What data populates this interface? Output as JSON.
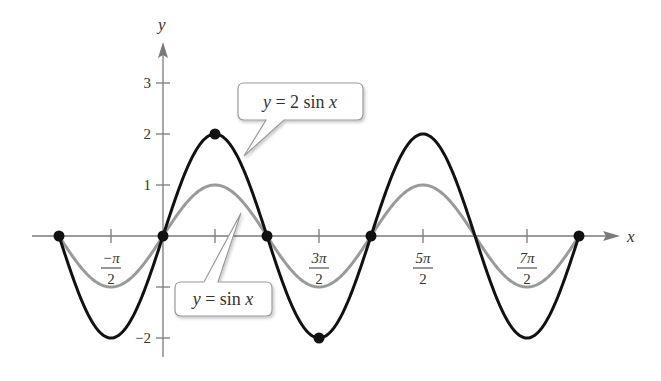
{
  "chart_data": {
    "type": "line",
    "title": "",
    "xlabel": "x",
    "ylabel": "y",
    "xlim": [
      -3.1416,
      12.5664
    ],
    "ylim": [
      -2.4,
      3.7
    ],
    "grid": false,
    "x_ticks": [
      {
        "value": -1.5708,
        "label_num": "−π",
        "label_den": "2",
        "labeled": true
      },
      {
        "value": 1.5708,
        "label_num": "",
        "label_den": "",
        "labeled": false
      },
      {
        "value": 4.7124,
        "label_num": "3π",
        "label_den": "2",
        "labeled": true
      },
      {
        "value": 7.854,
        "label_num": "5π",
        "label_den": "2",
        "labeled": true
      },
      {
        "value": 10.9956,
        "label_num": "7π",
        "label_den": "2",
        "labeled": true
      }
    ],
    "y_ticks": [
      {
        "value": 3,
        "label": "3"
      },
      {
        "value": 2,
        "label": "2"
      },
      {
        "value": 1,
        "label": "1"
      },
      {
        "value": -1,
        "label": ""
      },
      {
        "value": -2,
        "label": "−2"
      }
    ],
    "series": [
      {
        "name": "y = 2 sin x",
        "color": "#111111",
        "function": "2*sin(x)",
        "domain": [
          -3.1416,
          12.5664
        ],
        "x": [
          -3.1416,
          -1.5708,
          0,
          1.5708,
          3.1416,
          4.7124,
          6.2832,
          7.854,
          9.4248,
          10.9956,
          12.5664
        ],
        "values": [
          0,
          -2,
          0,
          2,
          0,
          -2,
          0,
          2,
          0,
          -2,
          0
        ]
      },
      {
        "name": "y = sin x",
        "color": "#9a9a9a",
        "function": "sin(x)",
        "domain": [
          -3.1416,
          12.5664
        ],
        "x": [
          -3.1416,
          -1.5708,
          0,
          1.5708,
          3.1416,
          4.7124,
          6.2832,
          7.854,
          9.4248,
          10.9956,
          12.5664
        ],
        "values": [
          0,
          -1,
          0,
          1,
          0,
          -1,
          0,
          1,
          0,
          -1,
          0
        ]
      }
    ],
    "marked_points": [
      {
        "x": -3.1416,
        "y": 0
      },
      {
        "x": 0,
        "y": 0
      },
      {
        "x": 1.5708,
        "y": 2
      },
      {
        "x": 3.1416,
        "y": 0
      },
      {
        "x": 4.7124,
        "y": -2
      },
      {
        "x": 6.2832,
        "y": 0
      },
      {
        "x": 12.5664,
        "y": 0
      }
    ],
    "annotations": [
      {
        "text_var": "y",
        "text_rest": " = 2 sin ",
        "text_var2": "x",
        "points_to_series": "y = 2 sin x"
      },
      {
        "text_var": "y",
        "text_rest": " = sin ",
        "text_var2": "x",
        "points_to_series": "y = sin x"
      }
    ]
  },
  "axes": {
    "x_label": "x",
    "y_label": "y"
  }
}
